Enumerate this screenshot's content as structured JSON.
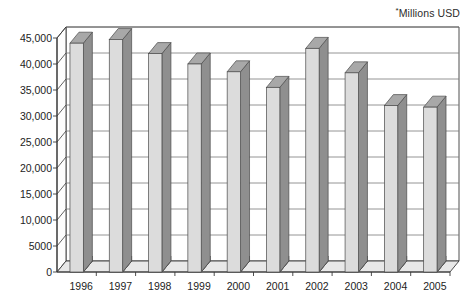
{
  "annotation": {
    "star": "*",
    "units_label": "Millions USD"
  },
  "chart_data": {
    "type": "bar",
    "title": "",
    "subtitle": "",
    "xlabel": "",
    "ylabel": "",
    "annotations": [
      "*Millions USD"
    ],
    "categories": [
      "1996",
      "1997",
      "1998",
      "1999",
      "2000",
      "2001",
      "2002",
      "2003",
      "2004",
      "2005"
    ],
    "values": [
      44000,
      44700,
      42000,
      40000,
      38500,
      35500,
      43000,
      38300,
      32000,
      31700
    ],
    "series": [
      {
        "name": "Value",
        "values": [
          44000,
          44700,
          42000,
          40000,
          38500,
          35500,
          43000,
          38300,
          32000,
          31700
        ]
      }
    ],
    "ylim": [
      0,
      45000
    ],
    "ytick_values": [
      0,
      5000,
      10000,
      15000,
      20000,
      25000,
      30000,
      35000,
      40000,
      45000
    ],
    "ytick_labels": [
      "0",
      "5000",
      "10,000",
      "15,000",
      "20,000",
      "25,000",
      "30,000",
      "35,000",
      "40,000",
      "45,000"
    ],
    "grid": true,
    "grid_axis": "y",
    "legend": false,
    "legend_position": "none",
    "style": "3d-column",
    "colors": {
      "bar_front": "#dcdcdc",
      "bar_side": "#8f8f8f",
      "bar_top": "#a8a8a8",
      "bar_outline": "#4a4a4a",
      "bar_base_dark": "#2f2f2f",
      "gridline": "#7a7a7a",
      "axis": "#3a3a3a",
      "floor": "#e8e8e8",
      "background": "#ffffff",
      "text": "#1d1d1d"
    }
  }
}
